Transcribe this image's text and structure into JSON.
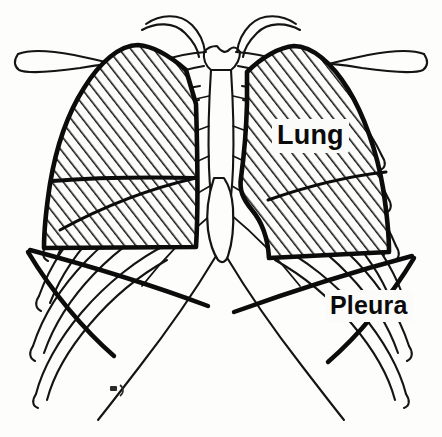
{
  "figure": {
    "kind": "anatomical-line-drawing",
    "view": "anterior",
    "background_color": "#fdfdfc",
    "ink_color": "#111111",
    "hatch_color": "#141414"
  },
  "labels": [
    {
      "id": "lung",
      "text": "Lung",
      "x": 272,
      "y": 119,
      "font_size": 27,
      "boxed": true
    },
    {
      "id": "pleura",
      "text": "Pleura",
      "x": 325,
      "y": 290,
      "font_size": 25,
      "boxed": true
    }
  ],
  "structures": {
    "lung_fill": "diagonal-hatching",
    "pleura_fill": "none",
    "left_lung_feature": "cardiac-notch",
    "right_lung_feature": "horizontal-fissure",
    "skeleton": [
      "clavicle-left",
      "clavicle-right",
      "manubrium",
      "sternum",
      "xiphoid-process",
      "ribs",
      "costal-margin"
    ]
  },
  "artist_mark": {
    "present": true,
    "x": 112,
    "y": 389
  }
}
